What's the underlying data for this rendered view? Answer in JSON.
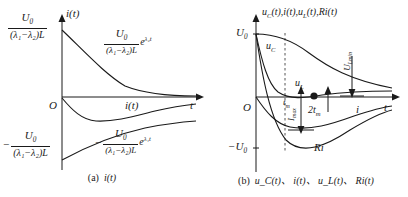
{
  "figure": {
    "background": "#ffffff",
    "stroke": "#1a1a1a"
  },
  "panel_a": {
    "caption_tag": "(a)",
    "caption_text": "i(t)",
    "axis": {
      "y_label": "i(t)",
      "x_label": "t",
      "origin_label": "O"
    },
    "labels": {
      "y_top_num": "U",
      "y_top_num_sub": "0",
      "y_top_den": "(λ₁−λ₂)L",
      "y_bottom_minus": "−",
      "y_bottom_num": "U",
      "y_bottom_num_sub": "0",
      "y_bottom_den": "(λ₁−λ₂)L",
      "curve_upper_num": "U",
      "curve_upper_num_sub": "0",
      "curve_upper_den": "(λ₁−λ₂)L",
      "curve_upper_exp": "e",
      "curve_upper_exp_sup": "λ₂t",
      "curve_lower_minus": "−",
      "curve_lower_num": "U",
      "curve_lower_num_sub": "0",
      "curve_lower_den": "(λ₁−λ₂)L",
      "curve_lower_exp": "e",
      "curve_lower_exp_sup": "λ₁t",
      "curve_mid": "i(t)"
    }
  },
  "panel_b": {
    "caption_tag": "(b)",
    "caption_text": "u_C(t)、 i(t)、 u_L(t)、 Ri(t)",
    "axis": {
      "y_title_parts": [
        "u",
        "C",
        "(t),",
        "i(t),",
        "u",
        "L",
        "(t),",
        "R",
        "i(t)"
      ],
      "x_label": "t",
      "origin_label": "O",
      "y_top_tick": "U",
      "y_top_tick_sub": "0",
      "y_bottom_tick": "−U",
      "y_bottom_tick_sub": "0"
    },
    "labels": {
      "uc": "u",
      "uc_sub": "C",
      "ul": "u",
      "ul_sub": "L",
      "ri": "Ri",
      "i": "i",
      "ulmin": "U",
      "ulmin_sub": "Lmin",
      "tm": "t",
      "tm_sub": "m",
      "imax": "I",
      "imax_sub": "max",
      "two_tm": "2t",
      "two_tm_sub": "m"
    }
  }
}
